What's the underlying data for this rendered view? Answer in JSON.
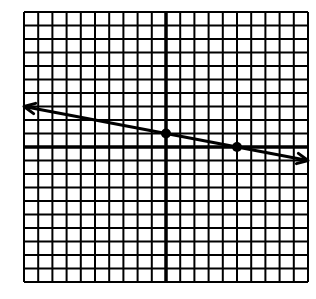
{
  "chart_data": {
    "type": "line",
    "title": "",
    "xlabel": "",
    "ylabel": "",
    "xlim": [
      -10,
      10
    ],
    "ylim": [
      -10,
      10
    ],
    "grid": true,
    "grid_step": 1,
    "legend": null,
    "series": [
      {
        "name": "line",
        "equation": "y = -x/5 + 1",
        "slope": -0.2,
        "y_intercept": 1,
        "arrows_both_ends": true,
        "x": [
          -10,
          10
        ],
        "y": [
          3,
          -1
        ]
      }
    ],
    "points": [
      {
        "x": 0,
        "y": 1
      },
      {
        "x": 5,
        "y": 0
      }
    ]
  },
  "colors": {
    "background": "#ffffff",
    "grid": "#000000",
    "line": "#000000"
  }
}
